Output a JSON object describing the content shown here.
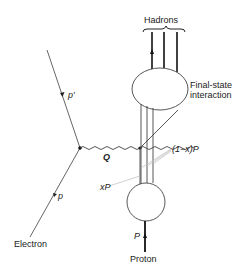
{
  "diagram": {
    "type": "feynman-diagram",
    "labels": {
      "hadrons": "Hadrons",
      "final_state_line1": "Final-state",
      "final_state_line2": "interaction",
      "p_prime": "p′",
      "p": "p",
      "Q": "Q",
      "one_minus_x_P": "(1−x)P",
      "xP": "xP",
      "P": "P",
      "electron": "Electron",
      "proton": "Proton"
    },
    "colors": {
      "line": "#333333",
      "leader": "#bbbbbb"
    }
  }
}
